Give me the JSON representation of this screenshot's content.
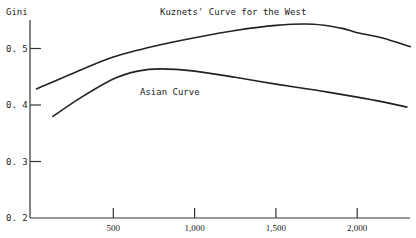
{
  "chart_data": {
    "type": "line",
    "title": "",
    "xlabel": "",
    "ylabel": "Gini",
    "xlim": [
      0,
      2350
    ],
    "ylim": [
      0.2,
      0.55
    ],
    "grid": false,
    "x_ticks": [
      {
        "value": 500,
        "label": "500"
      },
      {
        "value": 1000,
        "label": "1,000"
      },
      {
        "value": 1500,
        "label": "1,500"
      },
      {
        "value": 2000,
        "label": "2,000"
      }
    ],
    "y_ticks": [
      {
        "value": 0.5,
        "label": "0. 5"
      },
      {
        "value": 0.4,
        "label": "0. 4"
      },
      {
        "value": 0.3,
        "label": "0. 3"
      },
      {
        "value": 0.2,
        "label": "0. 2"
      }
    ],
    "series": [
      {
        "name": "Kuznets' Curve for the West",
        "x": [
          25,
          300,
          500,
          750,
          1000,
          1250,
          1500,
          1730,
          1900,
          2000,
          2150,
          2330
        ],
        "y": [
          0.428,
          0.462,
          0.485,
          0.504,
          0.519,
          0.532,
          0.541,
          0.543,
          0.536,
          0.528,
          0.519,
          0.503
        ]
      },
      {
        "name": "Asian Curve",
        "x": [
          125,
          300,
          500,
          650,
          790,
          1000,
          1250,
          1500,
          1750,
          2000,
          2150,
          2310
        ],
        "y": [
          0.379,
          0.413,
          0.446,
          0.46,
          0.464,
          0.46,
          0.449,
          0.437,
          0.426,
          0.414,
          0.406,
          0.396
        ]
      }
    ],
    "annotations": [
      {
        "text": "Kuznets' Curve for the West",
        "series": 0
      },
      {
        "text": "Asian Curve",
        "series": 1
      }
    ]
  }
}
